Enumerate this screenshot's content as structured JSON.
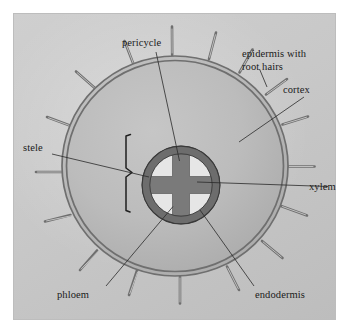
{
  "figure": {
    "background_color": "#ffffff",
    "panel_color": "#c9c9c9",
    "panel_border_color": "#bdbdbd"
  },
  "labels": {
    "pericycle": "pericycle",
    "epidermis": "epidermis with",
    "epidermis_line2": "root hairs",
    "cortex": "cortex",
    "xylem": "xylem",
    "stele": "stele",
    "phloem": "phloem",
    "endodermis": "endodermis"
  },
  "colors": {
    "cortex_fill": "#b9b9b9",
    "epidermis_stroke": "#6f6f6f",
    "endodermis_ring": "#6d6d6d",
    "xylem_fill": "#7a7a7a",
    "phloem_fill": "#e2e2e2",
    "leader_line": "#2a2a2a",
    "text": "#1a1a1a"
  },
  "structures": [
    {
      "name": "epidermis-with-root-hairs",
      "description": "outer double-line ring bearing root hairs"
    },
    {
      "name": "cortex",
      "description": "broad gray region between epidermis and stele"
    },
    {
      "name": "endodermis",
      "description": "dark ring enclosing the stele"
    },
    {
      "name": "pericycle",
      "description": "thin layer just inside the endodermis"
    },
    {
      "name": "stele",
      "description": "central vascular cylinder marked by a bracket"
    },
    {
      "name": "xylem",
      "description": "dark cross-shaped tissue at the centre"
    },
    {
      "name": "phloem",
      "description": "four pale patches between the xylem arms"
    }
  ],
  "root_hair_count": 16
}
